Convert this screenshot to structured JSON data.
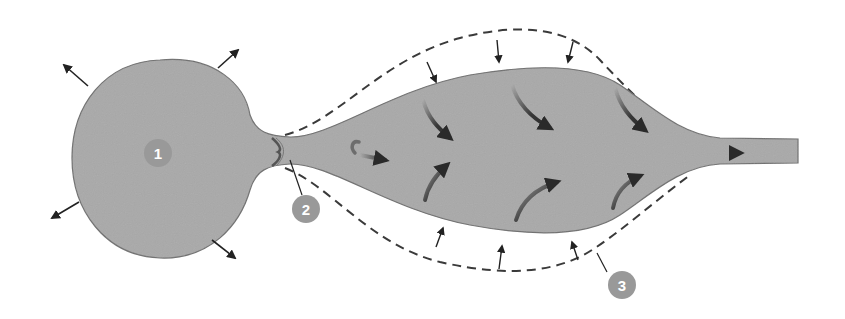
{
  "diagram": {
    "colors": {
      "background": "#ffffff",
      "body_fill": "#a9a9a9",
      "body_stroke": "#6e6e6e",
      "dashed_outline": "#3a3a3a",
      "arrow": "#222222",
      "callout_fill": "#9a9a9a",
      "callout_text": "#ffffff",
      "constriction": "#555555"
    },
    "callouts": [
      {
        "id": 1,
        "label": "1",
        "target": "bulb"
      },
      {
        "id": 2,
        "label": "2",
        "target": "constriction"
      },
      {
        "id": 3,
        "label": "3",
        "target": "dashed-outline"
      }
    ],
    "elements": {
      "bulb": "spherical chamber with outward radial arrows",
      "neck": "narrow constricted neck",
      "chamber": "elongated spindle chamber with internal curved flow arrows",
      "outlet": "narrow tube with rightward flow arrow",
      "dashed_outline": "expanded outline with inward-pointing compression arrows"
    }
  }
}
